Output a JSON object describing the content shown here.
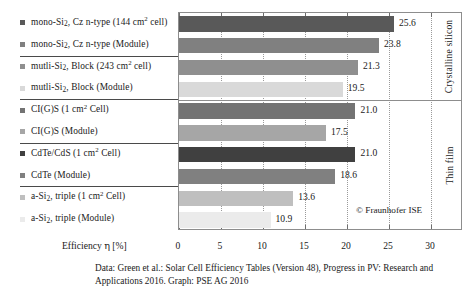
{
  "chart_data": {
    "type": "bar",
    "orientation": "horizontal",
    "title": "",
    "xlabel": "Efficiency η [%]",
    "ylabel": "",
    "xlim": [
      0,
      30
    ],
    "xticks": [
      0,
      5,
      10,
      15,
      20,
      25,
      30
    ],
    "xtick_labels": [
      "0",
      "5",
      "10",
      "15",
      "20",
      "25",
      "30"
    ],
    "grid": true,
    "legend": "none",
    "categories": [
      "mono-Si, Cz n-type (144 cm2 cell)",
      "mono-Si, Cz n-type (Module)",
      "mutli-Si, Block (243 cm2 cell)",
      "mutli-Si, Block (Module)",
      "CI(G)S (1 cm2 Cell)",
      "CI(G)S (Module)",
      "CdTe/CdS (1 cm2 Cell)",
      "CdTe (Module)",
      "a-Si, triple (1 cm2 Cell)",
      "a-Si, triple (Module)"
    ],
    "values": [
      25.6,
      23.8,
      21.3,
      19.5,
      21.0,
      17.5,
      21.0,
      18.6,
      13.6,
      10.9
    ],
    "value_labels": [
      "25.6",
      "23.8",
      "21.3",
      "19.5",
      "21.0",
      "17.5",
      "21.0",
      "18.6",
      "13.6",
      "10.9"
    ],
    "bar_colors": [
      "#595959",
      "#808080",
      "#8f8f8f",
      "#d9d9d9",
      "#737373",
      "#a6a6a6",
      "#404040",
      "#808080",
      "#bfbfbf",
      "#ebebeb"
    ],
    "groups": [
      {
        "label": "Crystalline silicon",
        "start": 0,
        "count": 4
      },
      {
        "label": "Thin film",
        "start": 4,
        "count": 6
      }
    ]
  },
  "rows": [
    {
      "marker_color": "#595959",
      "value": "25.6",
      "text_parts": [
        {
          "t": "mono-Si",
          "k": "n"
        },
        {
          "t": "2",
          "k": "sub"
        },
        {
          "t": ", Cz n-type (144 cm",
          "k": "n"
        },
        {
          "t": "2",
          "k": "sup"
        },
        {
          "t": " cell)",
          "k": "n"
        }
      ]
    },
    {
      "marker_color": "#808080",
      "value": "23.8",
      "text_parts": [
        {
          "t": "mono-Si",
          "k": "n"
        },
        {
          "t": "2",
          "k": "sub"
        },
        {
          "t": ", Cz n-type (Module)",
          "k": "n"
        }
      ]
    },
    {
      "marker_color": "#8f8f8f",
      "value": "21.3",
      "text_parts": [
        {
          "t": "mutli-Si",
          "k": "n"
        },
        {
          "t": "2",
          "k": "sub"
        },
        {
          "t": ", Block (243 cm",
          "k": "n"
        },
        {
          "t": "2",
          "k": "sup"
        },
        {
          "t": " cell)",
          "k": "n"
        }
      ]
    },
    {
      "marker_color": "#d9d9d9",
      "value": "19.5",
      "text_parts": [
        {
          "t": "mutli-Si",
          "k": "n"
        },
        {
          "t": "2",
          "k": "sub"
        },
        {
          "t": ", Block (Module)",
          "k": "n"
        }
      ]
    },
    {
      "marker_color": "#737373",
      "value": "21.0",
      "text_parts": [
        {
          "t": "CI(G)S (1 cm",
          "k": "n"
        },
        {
          "t": "2",
          "k": "sup"
        },
        {
          "t": " Cell)",
          "k": "n"
        }
      ]
    },
    {
      "marker_color": "#a6a6a6",
      "value": "17.5",
      "text_parts": [
        {
          "t": "CI(G)S (Module)",
          "k": "n"
        }
      ]
    },
    {
      "marker_color": "#404040",
      "value": "21.0",
      "text_parts": [
        {
          "t": "CdTe/CdS (1 cm",
          "k": "n"
        },
        {
          "t": "2",
          "k": "sup"
        },
        {
          "t": " Cell)",
          "k": "n"
        }
      ]
    },
    {
      "marker_color": "#808080",
      "value": "18.6",
      "text_parts": [
        {
          "t": "CdTe (Module)",
          "k": "n"
        }
      ]
    },
    {
      "marker_color": "#bfbfbf",
      "value": "13.6",
      "text_parts": [
        {
          "t": "a-Si",
          "k": "n"
        },
        {
          "t": "2",
          "k": "sub"
        },
        {
          "t": ", triple (1 cm",
          "k": "n"
        },
        {
          "t": "2",
          "k": "sup"
        },
        {
          "t": " Cell)",
          "k": "n"
        }
      ]
    },
    {
      "marker_color": "#ebebeb",
      "value": "10.9",
      "text_parts": [
        {
          "t": "a-Si",
          "k": "n"
        },
        {
          "t": "2",
          "k": "sub"
        },
        {
          "t": ", triple (Module)",
          "k": "n"
        }
      ]
    }
  ],
  "group_rules_after_rows": [
    1,
    3,
    5,
    7
  ],
  "side_panel": {
    "cells": [
      {
        "label": "Crystalline silicon",
        "start_row": 0,
        "rows": 4
      },
      {
        "label": "Thin film",
        "start_row": 4,
        "rows": 6
      }
    ]
  },
  "axis": {
    "title_prefix": "Efficiency ",
    "title_eta": "η",
    "title_suffix": " [%]",
    "ticks": [
      "0",
      "5",
      "10",
      "15",
      "20",
      "25",
      "30"
    ]
  },
  "copyright": "© Fraunhofer ISE",
  "caption": {
    "line1": "Data: Green et al.: Solar Cell Efficiency Tables (Version 48), Progress in PV: Research and",
    "line2": "Applications 2016. Graph: PSE AG 2016"
  }
}
